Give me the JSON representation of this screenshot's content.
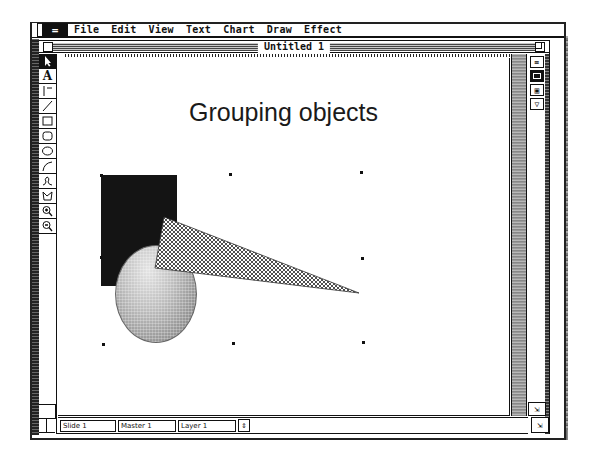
{
  "menubar": {
    "apple_label": "=",
    "items": [
      "File",
      "Edit",
      "View",
      "Text",
      "Chart",
      "Draw",
      "Effect"
    ]
  },
  "window": {
    "title": "Untitled 1"
  },
  "toolbox": {
    "tools": [
      {
        "name": "pointer",
        "glyph": "arrow",
        "selected": true
      },
      {
        "name": "text",
        "glyph": "A"
      },
      {
        "name": "orthogonal-line",
        "glyph": "perp-line"
      },
      {
        "name": "line",
        "glyph": "diagonal-line"
      },
      {
        "name": "rectangle",
        "glyph": "rect"
      },
      {
        "name": "rounded-rectangle",
        "glyph": "round-rect"
      },
      {
        "name": "oval",
        "glyph": "oval"
      },
      {
        "name": "arc",
        "glyph": "arc"
      },
      {
        "name": "freehand",
        "glyph": "freehand"
      },
      {
        "name": "polygon",
        "glyph": "polygon"
      },
      {
        "name": "zoom-in",
        "glyph": "magnifier-plus"
      },
      {
        "name": "zoom-out",
        "glyph": "magnifier-minus"
      }
    ]
  },
  "slide": {
    "title": "Grouping objects",
    "shapes": [
      {
        "type": "rectangle",
        "fill": "#141414"
      },
      {
        "type": "ellipse",
        "fill": "gradient-gray"
      },
      {
        "type": "triangle",
        "fill": "crosshatch"
      }
    ],
    "selection_handles": 8
  },
  "view_buttons": [
    {
      "name": "slide-view",
      "label": "≡"
    },
    {
      "name": "notes-view",
      "label": "",
      "active": true
    },
    {
      "name": "slide-sorter-view",
      "label": "▣"
    },
    {
      "name": "outline-view",
      "label": "▽"
    }
  ],
  "bottom_bar": {
    "slide_field": "Slide 1",
    "master_field": "Master 1",
    "layer_field": "Layer 1",
    "layer_popup": "⇕"
  },
  "colors": {
    "ink": "#111111",
    "paper": "#ffffff",
    "rect_fill": "#141414"
  }
}
